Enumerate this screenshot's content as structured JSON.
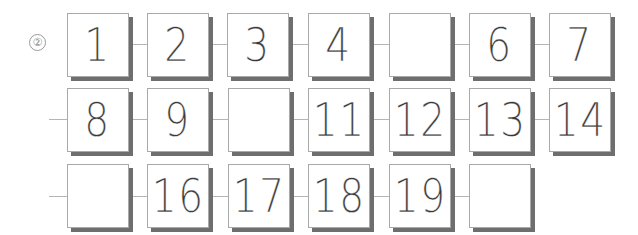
{
  "problem_marker": "②",
  "rows": [
    {
      "cells": [
        "1",
        "2",
        "3",
        "4",
        "",
        "6",
        "7"
      ]
    },
    {
      "cells": [
        "8",
        "9",
        "",
        "11",
        "12",
        "13",
        "14"
      ]
    },
    {
      "cells": [
        "",
        "16",
        "17",
        "18",
        "19",
        ""
      ]
    }
  ]
}
